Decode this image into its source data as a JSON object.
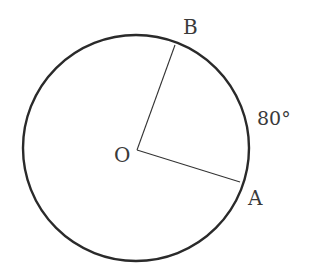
{
  "diagram": {
    "type": "circle-central-angle",
    "circle": {
      "cx": 136,
      "cy": 148,
      "r": 113,
      "stroke": "#2a2a2a"
    },
    "center": {
      "label": "O",
      "x": 137,
      "y": 150
    },
    "points": [
      {
        "label": "B",
        "x": 175,
        "y": 45
      },
      {
        "label": "A",
        "x": 240,
        "y": 182
      }
    ],
    "arc_label": "80°",
    "radii": [
      "OB",
      "OA"
    ]
  }
}
